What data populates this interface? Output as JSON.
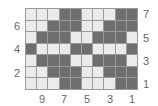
{
  "colors": {
    "light": "#ebebeb",
    "dark": "#6e6e6e",
    "gridline": "#9a9a9a",
    "label": "#666666"
  },
  "grid": {
    "columns": 10,
    "rows": 7,
    "cells_top_to_bottom": [
      [
        0,
        0,
        0,
        1,
        1,
        0,
        0,
        0,
        1,
        1
      ],
      [
        0,
        0,
        1,
        1,
        1,
        0,
        0,
        1,
        1,
        1
      ],
      [
        0,
        1,
        1,
        1,
        0,
        0,
        1,
        1,
        1,
        0
      ],
      [
        1,
        0,
        0,
        0,
        1,
        1,
        0,
        0,
        0,
        1
      ],
      [
        0,
        1,
        1,
        1,
        0,
        0,
        1,
        1,
        1,
        0
      ],
      [
        0,
        0,
        1,
        1,
        1,
        0,
        0,
        1,
        1,
        1
      ],
      [
        0,
        0,
        0,
        1,
        1,
        0,
        0,
        0,
        1,
        1
      ]
    ]
  },
  "labels": {
    "left_rows": [
      {
        "text": "6",
        "row": 6
      },
      {
        "text": "4",
        "row": 4
      },
      {
        "text": "2",
        "row": 2
      }
    ],
    "right_rows": [
      {
        "text": "7",
        "row": 7
      },
      {
        "text": "5",
        "row": 5
      },
      {
        "text": "3",
        "row": 3
      },
      {
        "text": "1",
        "row": 1
      }
    ],
    "bottom_cols": [
      {
        "text": "9",
        "col": 9
      },
      {
        "text": "7",
        "col": 7
      },
      {
        "text": "5",
        "col": 5
      },
      {
        "text": "3",
        "col": 3
      },
      {
        "text": "1",
        "col": 1
      }
    ]
  }
}
